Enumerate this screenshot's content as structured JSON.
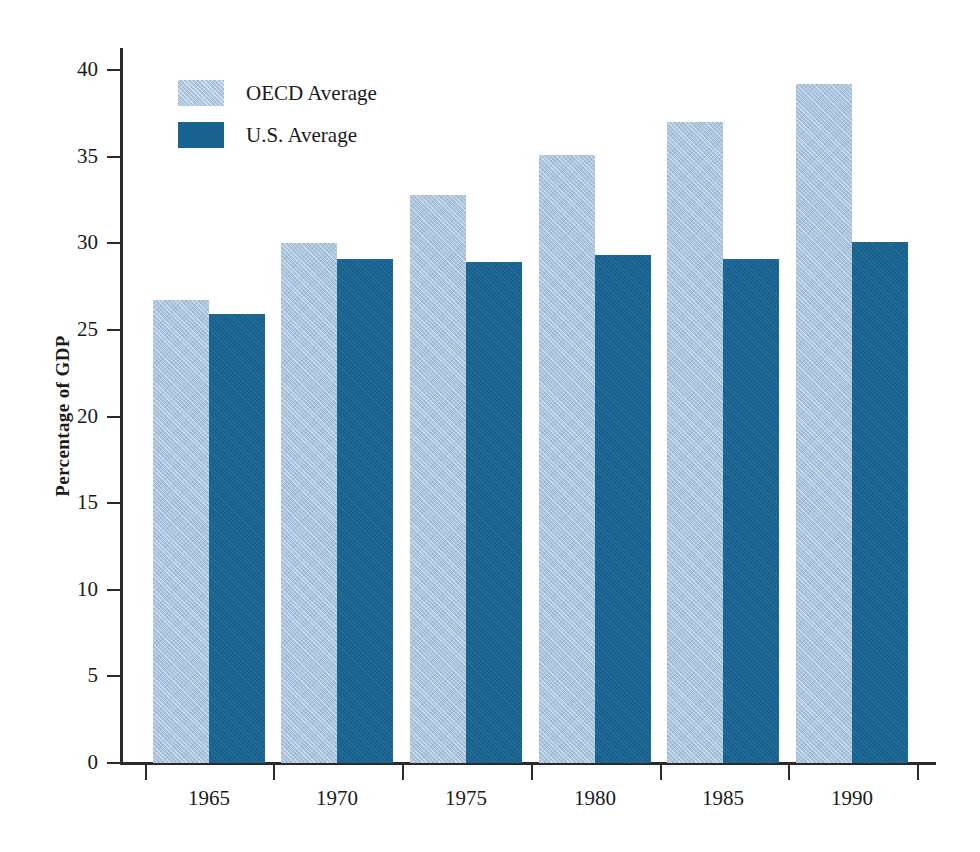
{
  "chart_data": {
    "type": "bar",
    "title": "",
    "subtitle": "",
    "xlabel": "",
    "ylabel": "Percentage of GDP",
    "categories": [
      "1965",
      "1970",
      "1975",
      "1980",
      "1985",
      "1990"
    ],
    "series": [
      {
        "name": "OECD Average",
        "color": "#a9c4dc",
        "values": [
          26.7,
          30.0,
          32.8,
          35.1,
          37.0,
          39.2
        ]
      },
      {
        "name": "U.S. Average",
        "color": "#17628f",
        "values": [
          25.9,
          29.1,
          28.9,
          29.3,
          29.1,
          30.1
        ]
      }
    ],
    "ylim": [
      0,
      40
    ],
    "yticks": [
      0,
      5,
      10,
      15,
      20,
      25,
      30,
      35,
      40
    ],
    "ytick_labels": [
      "0",
      "5",
      "10",
      "15",
      "20",
      "25",
      "30",
      "35",
      "40"
    ],
    "grid": false,
    "legend_position": "top-left",
    "legend_entries": [
      "OECD Average",
      "U.S. Average"
    ]
  },
  "axes": {
    "y_title": "Percentage of GDP"
  },
  "legend": {
    "items": [
      {
        "label": "OECD Average",
        "swatch": "legend-swatch-oecd"
      },
      {
        "label": "U.S. Average",
        "swatch": "legend-swatch-us"
      }
    ]
  }
}
